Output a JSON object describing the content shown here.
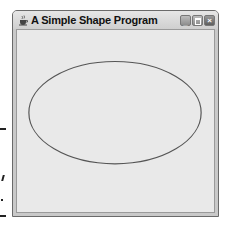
{
  "window": {
    "title": "A Simple Shape Program",
    "icon": "java-cup-icon",
    "controls": {
      "minimize": "minimize-icon",
      "maximize": "maximize-icon",
      "close": "close-icon"
    }
  },
  "canvas": {
    "shape": "ellipse",
    "stroke_color": "#555555",
    "fill": "none"
  },
  "colors": {
    "client_bg": "#e9e9e9",
    "frame": "#c9c9c9"
  }
}
